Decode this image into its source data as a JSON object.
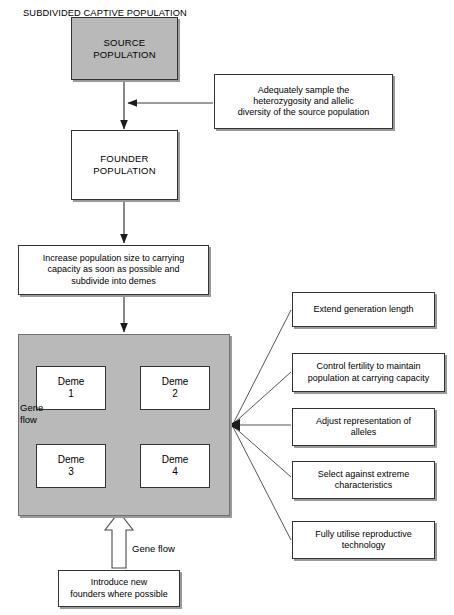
{
  "diagram": {
    "colors": {
      "block_fill": "#b9b9b9",
      "box_fill": "#ffffff",
      "stroke": "#333333",
      "arrow": "#3a3a3a"
    }
  },
  "nodes": {
    "source_population": {
      "line1": "SOURCE",
      "line2": "POPULATION"
    },
    "founder_population": {
      "line1": "FOUNDER",
      "line2": "POPULATION"
    },
    "sample_note": {
      "line1": "Adequately sample the",
      "line2": "heterozygosity and allelic",
      "line3": "diversity of the source population"
    },
    "increase_note": {
      "line1": "Increase population size to carrying",
      "line2": "capacity as soon as possible and",
      "line3": "subdivide into demes"
    },
    "subdivided_title": "SUBDIVIDED CAPTIVE POPULATION",
    "demes": [
      {
        "name": "Deme",
        "number": "1"
      },
      {
        "name": "Deme",
        "number": "2"
      },
      {
        "name": "Deme",
        "number": "3"
      },
      {
        "name": "Deme",
        "number": "4"
      }
    ],
    "gene_flow_label": {
      "line1": "Gene",
      "line2": "flow"
    },
    "gene_flow_bottom_label": "Gene flow",
    "introduce_note": {
      "line1": "Introduce new",
      "line2": "founders where possible"
    }
  },
  "management_actions": [
    {
      "line1": "Extend generation length",
      "line2": ""
    },
    {
      "line1": "Control fertility to maintain",
      "line2": "population at carrying capacity"
    },
    {
      "line1": "Adjust representation of",
      "line2": "alleles"
    },
    {
      "line1": "Select against extreme",
      "line2": "characteristics"
    },
    {
      "line1": "Fully utilise reproductive",
      "line2": "technology"
    }
  ]
}
